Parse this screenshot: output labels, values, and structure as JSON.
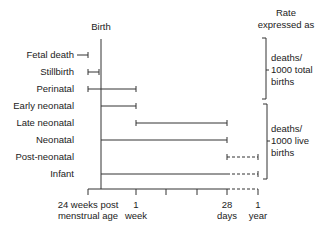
{
  "header": {
    "birth_label": "Birth",
    "rate_label_line1": "Rate",
    "rate_label_line2": "expressed as"
  },
  "rows": [
    {
      "label": "Fetal death",
      "start": "before 24 weeks",
      "end": "24 weeks post menstrual age",
      "style": "solid"
    },
    {
      "label": "Stillbirth",
      "start": "24 weeks post menstrual age",
      "end": "Birth",
      "style": "solid"
    },
    {
      "label": "Perinatal",
      "start": "24 weeks post menstrual age",
      "end": "1 week",
      "style": "solid"
    },
    {
      "label": "Early neonatal",
      "start": "Birth",
      "end": "1 week",
      "style": "solid"
    },
    {
      "label": "Late neonatal",
      "start": "1 week",
      "end": "28 days",
      "style": "solid"
    },
    {
      "label": "Neonatal",
      "start": "Birth",
      "end": "28 days",
      "style": "solid"
    },
    {
      "label": "Post-neonatal",
      "start": "28 days",
      "end": "1 year",
      "style": "dashed"
    },
    {
      "label": "Infant",
      "start": "Birth",
      "end": "1 year",
      "style": "solid to 28 days, dashed to 1 year"
    }
  ],
  "axis": {
    "ticks": [
      {
        "line1": "24 weeks post",
        "line2": "menstrual age"
      },
      {
        "line1": "1",
        "line2": "week"
      },
      {
        "line1": "",
        "line2": ""
      },
      {
        "line1": "",
        "line2": ""
      },
      {
        "line1": "28",
        "line2": "days"
      },
      {
        "line1": "1",
        "line2": "year"
      }
    ]
  },
  "brackets": [
    {
      "line1": "deaths/",
      "line2": "1000 total",
      "line3": "births",
      "covers": [
        "Fetal death",
        "Stillbirth",
        "Perinatal"
      ]
    },
    {
      "line1": "deaths/",
      "line2": "1000 live",
      "line3": "births",
      "covers": [
        "Early neonatal",
        "Late neonatal",
        "Neonatal",
        "Post-neonatal",
        "Infant"
      ]
    }
  ]
}
